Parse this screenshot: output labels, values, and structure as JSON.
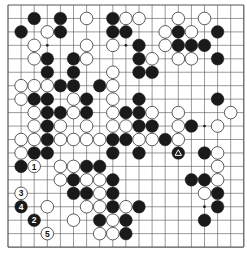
{
  "board": {
    "size": 19,
    "origin_x": 8,
    "origin_y": 5,
    "spacing_x": 13.1,
    "spacing_y": 13.45,
    "stone_radius": 6.3,
    "colors": {
      "background": "#ffffff",
      "line": "#555555",
      "black_stone": "#1a1a1a",
      "white_stone": "#ffffff",
      "white_stone_border": "#333333"
    },
    "star_points": [
      [
        3,
        3
      ],
      [
        9,
        3
      ],
      [
        15,
        3
      ],
      [
        3,
        9
      ],
      [
        9,
        9
      ],
      [
        15,
        9
      ],
      [
        3,
        15
      ],
      [
        9,
        15
      ],
      [
        15,
        15
      ]
    ]
  },
  "stones": [
    {
      "c": 2,
      "r": 1,
      "color": "B"
    },
    {
      "c": 4,
      "r": 1,
      "color": "B"
    },
    {
      "c": 6,
      "r": 1,
      "color": "W"
    },
    {
      "c": 8,
      "r": 1,
      "color": "B"
    },
    {
      "c": 9,
      "r": 1,
      "color": "W"
    },
    {
      "c": 10,
      "r": 1,
      "color": "W"
    },
    {
      "c": 13,
      "r": 1,
      "color": "W"
    },
    {
      "c": 15,
      "r": 1,
      "color": "W"
    },
    {
      "c": 1,
      "r": 2,
      "color": "B"
    },
    {
      "c": 3,
      "r": 2,
      "color": "W"
    },
    {
      "c": 4,
      "r": 2,
      "color": "B"
    },
    {
      "c": 8,
      "r": 2,
      "color": "B"
    },
    {
      "c": 9,
      "r": 2,
      "color": "B"
    },
    {
      "c": 12,
      "r": 2,
      "color": "W"
    },
    {
      "c": 13,
      "r": 2,
      "color": "B"
    },
    {
      "c": 14,
      "r": 2,
      "color": "W"
    },
    {
      "c": 16,
      "r": 2,
      "color": "B"
    },
    {
      "c": 2,
      "r": 3,
      "color": "W"
    },
    {
      "c": 6,
      "r": 3,
      "color": "W"
    },
    {
      "c": 8,
      "r": 3,
      "color": "W"
    },
    {
      "c": 10,
      "r": 3,
      "color": "B"
    },
    {
      "c": 12,
      "r": 3,
      "color": "W"
    },
    {
      "c": 13,
      "r": 3,
      "color": "B"
    },
    {
      "c": 14,
      "r": 3,
      "color": "B"
    },
    {
      "c": 15,
      "r": 3,
      "color": "B"
    },
    {
      "c": 2,
      "r": 4,
      "color": "W"
    },
    {
      "c": 3,
      "r": 4,
      "color": "B"
    },
    {
      "c": 5,
      "r": 4,
      "color": "B"
    },
    {
      "c": 6,
      "r": 4,
      "color": "W"
    },
    {
      "c": 10,
      "r": 4,
      "color": "B"
    },
    {
      "c": 11,
      "r": 4,
      "color": "W"
    },
    {
      "c": 13,
      "r": 4,
      "color": "W"
    },
    {
      "c": 14,
      "r": 4,
      "color": "W"
    },
    {
      "c": 16,
      "r": 4,
      "color": "B"
    },
    {
      "c": 3,
      "r": 5,
      "color": "B"
    },
    {
      "c": 5,
      "r": 5,
      "color": "B"
    },
    {
      "c": 8,
      "r": 5,
      "color": "W"
    },
    {
      "c": 10,
      "r": 5,
      "color": "B"
    },
    {
      "c": 11,
      "r": 5,
      "color": "B"
    },
    {
      "c": 1,
      "r": 6,
      "color": "W"
    },
    {
      "c": 2,
      "r": 6,
      "color": "W"
    },
    {
      "c": 3,
      "r": 6,
      "color": "W"
    },
    {
      "c": 4,
      "r": 6,
      "color": "B"
    },
    {
      "c": 5,
      "r": 6,
      "color": "B"
    },
    {
      "c": 7,
      "r": 6,
      "color": "B"
    },
    {
      "c": 8,
      "r": 6,
      "color": "W"
    },
    {
      "c": 1,
      "r": 7,
      "color": "W"
    },
    {
      "c": 2,
      "r": 7,
      "color": "B"
    },
    {
      "c": 3,
      "r": 7,
      "color": "B"
    },
    {
      "c": 5,
      "r": 7,
      "color": "W"
    },
    {
      "c": 6,
      "r": 7,
      "color": "B"
    },
    {
      "c": 8,
      "r": 7,
      "color": "W"
    },
    {
      "c": 10,
      "r": 7,
      "color": "B"
    },
    {
      "c": 16,
      "r": 7,
      "color": "B"
    },
    {
      "c": 2,
      "r": 8,
      "color": "W"
    },
    {
      "c": 3,
      "r": 8,
      "color": "B"
    },
    {
      "c": 4,
      "r": 8,
      "color": "B"
    },
    {
      "c": 5,
      "r": 8,
      "color": "W"
    },
    {
      "c": 6,
      "r": 8,
      "color": "B"
    },
    {
      "c": 8,
      "r": 8,
      "color": "W"
    },
    {
      "c": 9,
      "r": 8,
      "color": "B"
    },
    {
      "c": 10,
      "r": 8,
      "color": "B"
    },
    {
      "c": 11,
      "r": 8,
      "color": "W"
    },
    {
      "c": 13,
      "r": 8,
      "color": "W"
    },
    {
      "c": 17,
      "r": 8,
      "color": "W"
    },
    {
      "c": 2,
      "r": 9,
      "color": "W"
    },
    {
      "c": 3,
      "r": 9,
      "color": "B"
    },
    {
      "c": 4,
      "r": 9,
      "color": "W"
    },
    {
      "c": 6,
      "r": 9,
      "color": "W"
    },
    {
      "c": 8,
      "r": 9,
      "color": "W"
    },
    {
      "c": 9,
      "r": 9,
      "color": "W"
    },
    {
      "c": 10,
      "r": 9,
      "color": "B"
    },
    {
      "c": 11,
      "r": 9,
      "color": "B"
    },
    {
      "c": 13,
      "r": 9,
      "color": "W"
    },
    {
      "c": 14,
      "r": 9,
      "color": "B"
    },
    {
      "c": 16,
      "r": 9,
      "color": "W"
    },
    {
      "c": 1,
      "r": 10,
      "color": "W"
    },
    {
      "c": 2,
      "r": 10,
      "color": "W"
    },
    {
      "c": 3,
      "r": 10,
      "color": "B"
    },
    {
      "c": 4,
      "r": 10,
      "color": "W"
    },
    {
      "c": 5,
      "r": 10,
      "color": "W"
    },
    {
      "c": 6,
      "r": 10,
      "color": "W"
    },
    {
      "c": 7,
      "r": 10,
      "color": "W"
    },
    {
      "c": 8,
      "r": 10,
      "color": "B"
    },
    {
      "c": 9,
      "r": 10,
      "color": "B"
    },
    {
      "c": 10,
      "r": 10,
      "color": "W"
    },
    {
      "c": 11,
      "r": 10,
      "color": "W"
    },
    {
      "c": 12,
      "r": 10,
      "color": "B"
    },
    {
      "c": 13,
      "r": 10,
      "color": "W"
    },
    {
      "c": 1,
      "r": 11,
      "color": "W"
    },
    {
      "c": 2,
      "r": 11,
      "color": "B"
    },
    {
      "c": 3,
      "r": 11,
      "color": "B"
    },
    {
      "c": 8,
      "r": 11,
      "color": "B"
    },
    {
      "c": 10,
      "r": 11,
      "color": "B"
    },
    {
      "c": 13,
      "r": 11,
      "color": "B",
      "marker": "triangle"
    },
    {
      "c": 15,
      "r": 11,
      "color": "B"
    },
    {
      "c": 16,
      "r": 11,
      "color": "W"
    },
    {
      "c": 1,
      "r": 12,
      "color": "B"
    },
    {
      "c": 2,
      "r": 12,
      "color": "W",
      "label": "1"
    },
    {
      "c": 4,
      "r": 12,
      "color": "W"
    },
    {
      "c": 5,
      "r": 12,
      "color": "W"
    },
    {
      "c": 6,
      "r": 12,
      "color": "B"
    },
    {
      "c": 7,
      "r": 12,
      "color": "B"
    },
    {
      "c": 16,
      "r": 12,
      "color": "W"
    },
    {
      "c": 4,
      "r": 13,
      "color": "W"
    },
    {
      "c": 5,
      "r": 13,
      "color": "B"
    },
    {
      "c": 6,
      "r": 13,
      "color": "W"
    },
    {
      "c": 7,
      "r": 13,
      "color": "W"
    },
    {
      "c": 8,
      "r": 13,
      "color": "B"
    },
    {
      "c": 14,
      "r": 13,
      "color": "B"
    },
    {
      "c": 15,
      "r": 13,
      "color": "B"
    },
    {
      "c": 16,
      "r": 13,
      "color": "W"
    },
    {
      "c": 1,
      "r": 14,
      "color": "W",
      "label": "3"
    },
    {
      "c": 5,
      "r": 14,
      "color": "B"
    },
    {
      "c": 6,
      "r": 14,
      "color": "B"
    },
    {
      "c": 7,
      "r": 14,
      "color": "W"
    },
    {
      "c": 8,
      "r": 14,
      "color": "B"
    },
    {
      "c": 15,
      "r": 14,
      "color": "W"
    },
    {
      "c": 16,
      "r": 14,
      "color": "B"
    },
    {
      "c": 1,
      "r": 15,
      "color": "B",
      "label": "4"
    },
    {
      "c": 3,
      "r": 15,
      "color": "W"
    },
    {
      "c": 6,
      "r": 15,
      "color": "W"
    },
    {
      "c": 7,
      "r": 15,
      "color": "W"
    },
    {
      "c": 8,
      "r": 15,
      "color": "B"
    },
    {
      "c": 9,
      "r": 15,
      "color": "W"
    },
    {
      "c": 10,
      "r": 15,
      "color": "B"
    },
    {
      "c": 16,
      "r": 15,
      "color": "B"
    },
    {
      "c": 2,
      "r": 16,
      "color": "B",
      "label": "2"
    },
    {
      "c": 5,
      "r": 16,
      "color": "W"
    },
    {
      "c": 7,
      "r": 16,
      "color": "B"
    },
    {
      "c": 8,
      "r": 16,
      "color": "W"
    },
    {
      "c": 9,
      "r": 16,
      "color": "B"
    },
    {
      "c": 15,
      "r": 16,
      "color": "B"
    },
    {
      "c": 3,
      "r": 17,
      "color": "W",
      "label": "5"
    },
    {
      "c": 7,
      "r": 17,
      "color": "W"
    },
    {
      "c": 8,
      "r": 17,
      "color": "W"
    },
    {
      "c": 9,
      "r": 17,
      "color": "B"
    }
  ],
  "move_labels": [
    "1",
    "2",
    "3",
    "4",
    "5"
  ],
  "marker_legend": {
    "triangle": "last-move-marker"
  }
}
